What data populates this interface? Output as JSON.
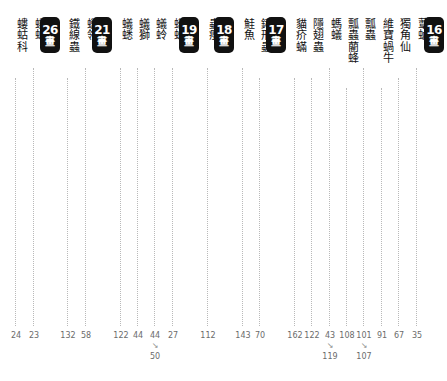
{
  "page": {
    "kind": "book-index-stroke-column-strip",
    "background": "#ffffff",
    "badge_color": "#111111",
    "badge_text_color": "#ffffff",
    "leader_color": "#b9b9b9",
    "page_number_color": "#6b6b6b",
    "badge_unit": "畫"
  },
  "columns": [
    {
      "type": "label",
      "text": "螻蛄科",
      "x": 6,
      "leader_top": 78,
      "leader_bottom": 326,
      "page": "24",
      "page2": null
    },
    {
      "type": "label",
      "text": "螻蛄",
      "x": 26,
      "leader_top": 68,
      "leader_bottom": 326,
      "page": "23",
      "page2": null
    },
    {
      "type": "badge",
      "text": "26",
      "x": 45,
      "leader_top": 0,
      "leader_bottom": 0,
      "page": null,
      "page2": null
    },
    {
      "type": "label",
      "text": "鐵線蟲",
      "x": 66,
      "leader_top": 78,
      "leader_bottom": 326,
      "page": "132",
      "page2": null
    },
    {
      "type": "label",
      "text": "蠟鴒",
      "x": 86,
      "leader_top": 68,
      "leader_bottom": 326,
      "page": "58",
      "page2": null
    },
    {
      "type": "badge",
      "text": "21",
      "x": 105,
      "leader_top": 0,
      "leader_bottom": 0,
      "page": null,
      "page2": null
    },
    {
      "type": "label",
      "text": "蟻蟋",
      "x": 126,
      "leader_top": 68,
      "leader_bottom": 326,
      "page": "122",
      "page2": null
    },
    {
      "type": "label",
      "text": "蟻獅",
      "x": 146,
      "leader_top": 68,
      "leader_bottom": 326,
      "page": "44",
      "page2": null
    },
    {
      "type": "label",
      "text": "蟻蛉",
      "x": 166,
      "leader_top": 68,
      "leader_bottom": 326,
      "page": "44",
      "page2": "50"
    },
    {
      "type": "label",
      "text": "蟻蛛",
      "x": 186,
      "leader_top": 68,
      "leader_bottom": 326,
      "page": "27",
      "page2": null
    },
    {
      "type": "badge",
      "text": "19",
      "x": 205,
      "leader_top": 0,
      "leader_bottom": 0,
      "page": null,
      "page2": null
    },
    {
      "type": "label",
      "text": "蟲癭",
      "x": 226,
      "leader_top": 68,
      "leader_bottom": 326,
      "page": "112",
      "page2": null
    },
    {
      "type": "badge",
      "text": "18",
      "x": 245,
      "leader_top": 0,
      "leader_bottom": 0,
      "page": null,
      "page2": null
    },
    {
      "type": "label",
      "text": "鮭魚",
      "x": 266,
      "leader_top": 68,
      "leader_bottom": 326,
      "page": "143",
      "page2": null
    },
    {
      "type": "label",
      "text": "鍬形蟲",
      "x": 286,
      "leader_top": 78,
      "leader_bottom": 326,
      "page": "70",
      "page2": null
    },
    {
      "type": "badge",
      "text": "17",
      "x": 305,
      "leader_top": 0,
      "leader_bottom": 0,
      "page": null,
      "page2": null
    },
    {
      "type": "label",
      "text": "貓疥蟎",
      "x": 326,
      "leader_top": 78,
      "leader_bottom": 326,
      "page": "162",
      "page2": null
    },
    {
      "type": "label",
      "text": "隱翅蟲",
      "x": 346,
      "leader_top": 78,
      "leader_bottom": 326,
      "page": "122",
      "page2": null
    },
    {
      "type": "label",
      "text": "螞蟻",
      "x": 366,
      "leader_top": 68,
      "leader_bottom": 326,
      "page": "43",
      "page2": "119"
    },
    {
      "type": "label",
      "text": "瓢蟲藺蜂",
      "x": 386,
      "leader_top": 88,
      "leader_bottom": 326,
      "page": "108",
      "page2": null
    },
    {
      "type": "label",
      "text": "瓢蟲",
      "x": 406,
      "leader_top": 68,
      "leader_bottom": 326,
      "page": "101",
      "page2": "107"
    },
    {
      "type": "label",
      "text": "維寶蝸牛",
      "x": 426,
      "leader_top": 88,
      "leader_bottom": 326,
      "page": "91",
      "page2": null
    },
    {
      "type": "label",
      "text": "獨角仙",
      "x": 446,
      "leader_top": 78,
      "leader_bottom": 326,
      "page": "67",
      "page2": null
    },
    {
      "type": "label",
      "text": "蕈蚋",
      "x": 466,
      "leader_top": 68,
      "leader_bottom": 326,
      "page": "35",
      "page2": null
    },
    {
      "type": "badge",
      "text": "16",
      "x": 486,
      "leader_top": 0,
      "leader_bottom": 0,
      "page": null,
      "page2": null
    }
  ]
}
